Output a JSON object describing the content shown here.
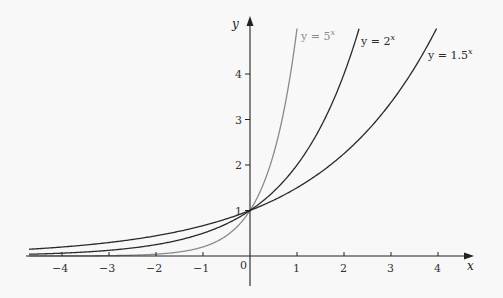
{
  "chart_data": {
    "type": "line",
    "title": "",
    "xlabel": "x",
    "ylabel": "y",
    "xlim": [
      -4.7,
      4.6
    ],
    "ylim": [
      -0.7,
      5.1
    ],
    "grid": false,
    "legend": "inline curve labels",
    "x_ticks": [
      -4,
      -3,
      -2,
      -1,
      0,
      1,
      2,
      3,
      4
    ],
    "x_tick_labels": [
      "−4",
      "−3",
      "−2",
      "−1",
      "0",
      "1",
      "2",
      "3",
      "4"
    ],
    "y_ticks": [
      1,
      2,
      3,
      4
    ],
    "y_tick_labels": [
      "1",
      "2",
      "3",
      "4"
    ],
    "series": [
      {
        "name": "y = 5^x",
        "label_base": "y = 5",
        "label_exp": "x",
        "base": 5,
        "color": "#8a8a8a",
        "x_range": [
          -4.7,
          1.0
        ]
      },
      {
        "name": "y = 2^x",
        "label_base": "y = 2",
        "label_exp": "x",
        "base": 2,
        "color": "#2a2a2a",
        "x_range": [
          -4.7,
          2.32
        ]
      },
      {
        "name": "y = 1.5^x",
        "label_base": "y = 1.5",
        "label_exp": "x",
        "base": 1.5,
        "color": "#2a2a2a",
        "x_range": [
          -4.7,
          3.97
        ]
      }
    ]
  }
}
